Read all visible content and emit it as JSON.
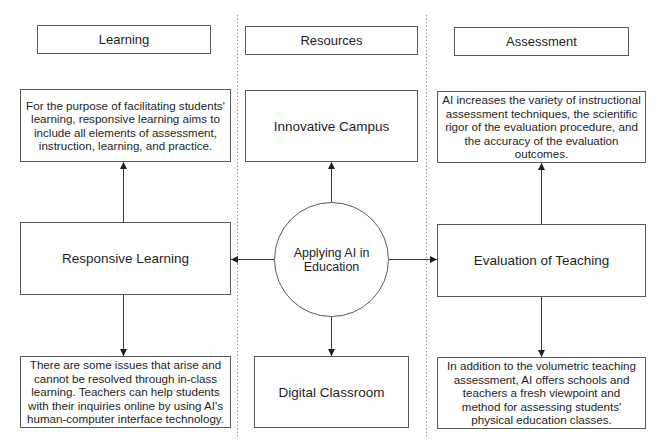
{
  "columns": {
    "learning": {
      "header": "Learning",
      "top_text": "For the purpose of facilitating students' learning, responsive learning aims to include all elements of assessment, instruction, learning, and practice.",
      "middle_title": "Responsive Learning",
      "bottom_text": "There are some issues that arise and cannot be resolved through in-class learning. Teachers can help students with their inquiries online by using AI's human-computer interface technology."
    },
    "resources": {
      "header": "Resources",
      "top_title": "Innovative Campus",
      "center_title": "Applying AI in Education",
      "bottom_title": "Digital Classroom"
    },
    "assessment": {
      "header": "Assessment",
      "top_text": "AI increases the variety of instructional assessment techniques, the scientific rigor of the evaluation procedure, and the accuracy of the evaluation outcomes.",
      "middle_title": "Evaluation of Teaching",
      "bottom_text": "In addition to the volumetric teaching assessment, AI offers schools and teachers a fresh viewpoint and method for assessing students' physical education classes."
    }
  },
  "colors": {
    "stroke": "#5a5a5a",
    "divider": "#9a9a9a",
    "text": "#1e1e1e",
    "background": "#ffffff"
  }
}
